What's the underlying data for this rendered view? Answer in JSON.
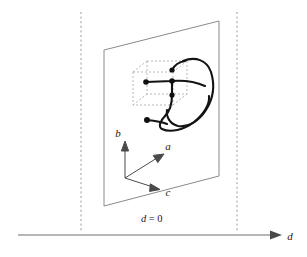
{
  "figure": {
    "background_color": "#ffffff",
    "width": 307,
    "height": 257
  },
  "colors": {
    "plane_stroke": "#8a8a8a",
    "dashed_guide": "#9a9a9a",
    "cube_stroke": "#a8a8a8",
    "curve_stroke": "#141414",
    "axis_stroke": "#4a4a4a",
    "baseline_stroke": "#6e6e6e",
    "dot_fill": "#111111",
    "text_color": "#1a1a1a"
  },
  "axes": {
    "triad_origin": {
      "x": 125,
      "y": 178
    },
    "items": [
      {
        "name": "b",
        "label": "b",
        "label_x": 120,
        "label_y": 136,
        "tip_x": 125,
        "tip_y": 143
      },
      {
        "name": "a",
        "label": "a",
        "label_x": 167,
        "label_y": 148,
        "tip_x": 163,
        "tip_y": 154
      },
      {
        "name": "c",
        "label": "c",
        "label_x": 167,
        "label_y": 194,
        "tip_x": 159,
        "tip_y": 189
      }
    ]
  },
  "plane": {
    "name": "plane-d-equals-0",
    "label": "d = 0",
    "label_parts": {
      "symbol": "d",
      "relation": "= 0"
    },
    "label_x": 141,
    "label_y": 222,
    "corners": [
      {
        "x": 104,
        "y": 50
      },
      {
        "x": 219,
        "y": 21
      },
      {
        "x": 219,
        "y": 176
      },
      {
        "x": 104,
        "y": 206
      }
    ]
  },
  "guides": {
    "left_dashed_x": 81,
    "right_dashed_x": 237,
    "dashed_top_y": 12,
    "dashed_bottom_y": 232
  },
  "baseline": {
    "name": "d-axis",
    "label": "d",
    "label_x": 288,
    "label_y": 240,
    "start_x": 18,
    "end_x": 280,
    "y": 235,
    "arrow_tip_x": 281
  },
  "dashed_box": {
    "name": "dashed-cube",
    "front": {
      "x": 133,
      "y": 72,
      "w": 40,
      "h": 33
    },
    "depth": {
      "dx": 14,
      "dy": -11
    }
  },
  "curve": {
    "name": "knotted-strand",
    "stroke_width": 2.1,
    "description": "open knotted arc with two free endpoints marked by dots"
  },
  "dots": [
    {
      "name": "endpoint-left-in-box",
      "x": 146,
      "y": 82,
      "r": 2.8
    },
    {
      "name": "node-center",
      "x": 172,
      "y": 81,
      "r": 2.8
    },
    {
      "name": "node-upper",
      "x": 172,
      "y": 70,
      "r": 2.6
    },
    {
      "name": "node-lower",
      "x": 172,
      "y": 95,
      "r": 2.6
    },
    {
      "name": "endpoint-lower-left",
      "x": 147,
      "y": 120,
      "r": 3.0
    }
  ]
}
